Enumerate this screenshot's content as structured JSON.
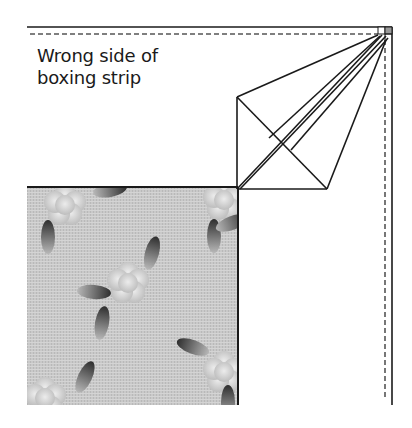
{
  "label": {
    "line1": "Wrong side of",
    "line2": "boxing strip"
  },
  "colors": {
    "stroke": "#1a1a1a",
    "fabric_base": "#c8c8c8",
    "flower": "#dedede",
    "leaf_dark": "#3a3a3a",
    "leaf_light": "#bdbdbd",
    "corner_square": "#9a9a9a"
  }
}
